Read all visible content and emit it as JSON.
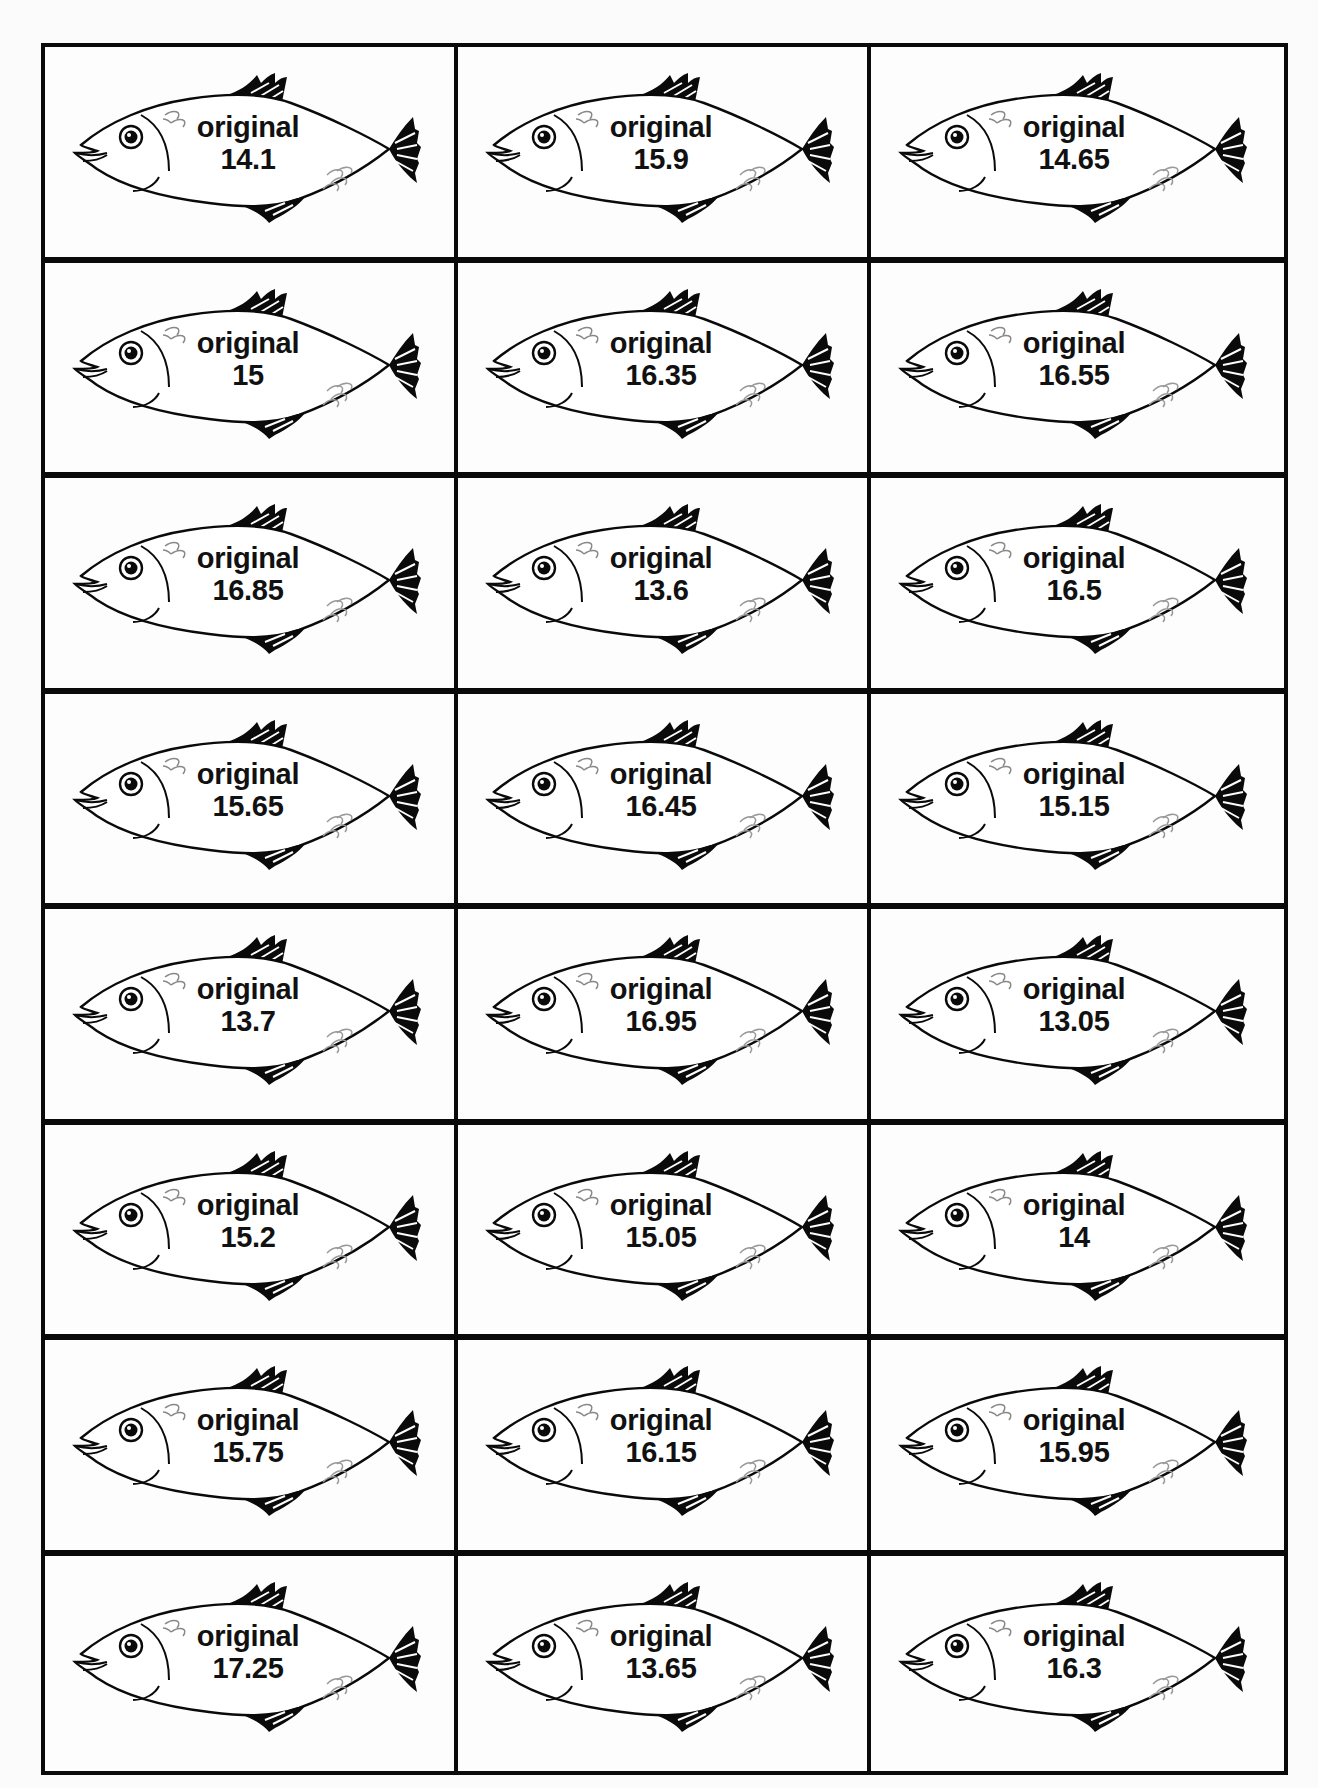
{
  "sheet": {
    "columns": 3,
    "rows": 8,
    "cards": [
      {
        "label": "original",
        "value": "14.1"
      },
      {
        "label": "original",
        "value": "15.9"
      },
      {
        "label": "original",
        "value": "14.65"
      },
      {
        "label": "original",
        "value": "15"
      },
      {
        "label": "original",
        "value": "16.35"
      },
      {
        "label": "original",
        "value": "16.55"
      },
      {
        "label": "original",
        "value": "16.85"
      },
      {
        "label": "original",
        "value": "13.6"
      },
      {
        "label": "original",
        "value": "16.5"
      },
      {
        "label": "original",
        "value": "15.65"
      },
      {
        "label": "original",
        "value": "16.45"
      },
      {
        "label": "original",
        "value": "15.15"
      },
      {
        "label": "original",
        "value": "13.7"
      },
      {
        "label": "original",
        "value": "16.95"
      },
      {
        "label": "original",
        "value": "13.05"
      },
      {
        "label": "original",
        "value": "15.2"
      },
      {
        "label": "original",
        "value": "15.05"
      },
      {
        "label": "original",
        "value": "14"
      },
      {
        "label": "original",
        "value": "15.75"
      },
      {
        "label": "original",
        "value": "16.15"
      },
      {
        "label": "original",
        "value": "15.95"
      },
      {
        "label": "original",
        "value": "17.25"
      },
      {
        "label": "original",
        "value": "13.65"
      },
      {
        "label": "original",
        "value": "16.3"
      }
    ]
  },
  "colors": {
    "ink": "#0a0a0a",
    "paper": "#fdfdfd",
    "scales": "#9a9a9a"
  },
  "icon": "fish-icon"
}
